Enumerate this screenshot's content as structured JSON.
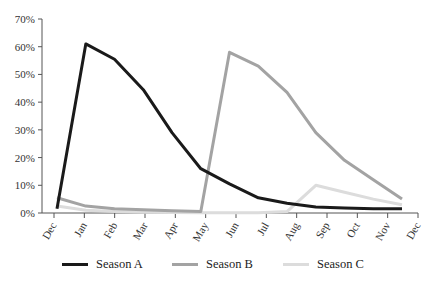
{
  "chart_data": {
    "type": "line",
    "title": "",
    "xlabel": "",
    "ylabel": "",
    "x": [
      "Dec",
      "Jan",
      "Feb",
      "Mar",
      "Apr",
      "May",
      "Jun",
      "Jul",
      "Aug",
      "Sep",
      "Oct",
      "Nov",
      "Dec"
    ],
    "ylim": [
      0,
      70
    ],
    "yticks": [
      "0%",
      "10%",
      "20%",
      "30%",
      "40%",
      "50%",
      "60%",
      "70%"
    ],
    "grid": false,
    "legend_position": "bottom",
    "series": [
      {
        "name": "Season A",
        "color": "#1a1a1a",
        "values": [
          1.5,
          61,
          55.5,
          44.5,
          29,
          16,
          10.5,
          5.5,
          3.5,
          2.2,
          1.8,
          1.5,
          1.5
        ]
      },
      {
        "name": "Season B",
        "color": "#a3a3a3",
        "values": [
          5.5,
          2.5,
          1.5,
          1.2,
          0.8,
          0.5,
          58,
          53,
          43.5,
          29,
          19,
          12,
          5
        ]
      },
      {
        "name": "Season C",
        "color": "#dcdcdc",
        "values": [
          2.5,
          1,
          0.5,
          0.3,
          0.2,
          0.1,
          0.1,
          0.1,
          0.5,
          10,
          7.5,
          5,
          3
        ]
      }
    ]
  },
  "legend": {
    "items": [
      {
        "label": "Season A"
      },
      {
        "label": "Season B"
      },
      {
        "label": "Season C"
      }
    ]
  }
}
